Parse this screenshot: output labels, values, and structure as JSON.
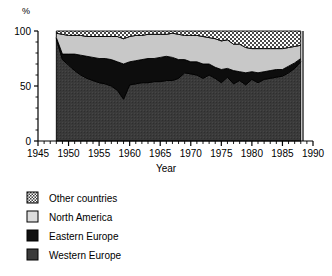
{
  "chart_data": {
    "type": "area",
    "stacked": true,
    "title": "",
    "xlabel": "Year",
    "ylabel": "%",
    "ylim": [
      0,
      100
    ],
    "xlim": [
      1945,
      1990
    ],
    "yticks": [
      0,
      50,
      100
    ],
    "ytick_labels": [
      "0",
      "50",
      "100"
    ],
    "xticks": [
      1945,
      1950,
      1955,
      1960,
      1965,
      1970,
      1975,
      1980,
      1985,
      1990
    ],
    "xtick_labels": [
      "1945",
      "1950",
      "1955",
      "1960",
      "1965",
      "1970",
      "1975",
      "1980",
      "1985",
      "1990"
    ],
    "minor_tick_interval": 1,
    "grid": false,
    "legend_position": "below",
    "data_start_year": 1948,
    "data_end_year": 1988,
    "x": [
      1948,
      1949,
      1950,
      1951,
      1952,
      1953,
      1954,
      1955,
      1956,
      1957,
      1958,
      1959,
      1960,
      1961,
      1962,
      1963,
      1964,
      1965,
      1966,
      1967,
      1968,
      1969,
      1970,
      1971,
      1972,
      1973,
      1974,
      1975,
      1976,
      1977,
      1978,
      1979,
      1980,
      1981,
      1982,
      1983,
      1984,
      1985,
      1986,
      1987,
      1988
    ],
    "series": [
      {
        "name": "Western Europe",
        "pattern": "solid-dark-gray",
        "color": "#3a3a3a",
        "values": [
          93,
          74,
          69,
          64,
          60,
          57,
          55,
          53,
          52,
          50,
          46,
          38,
          51,
          52,
          53,
          53,
          54,
          54,
          55,
          55,
          57,
          62,
          61,
          60,
          57,
          60,
          57,
          53,
          58,
          52,
          55,
          51,
          56,
          53,
          56,
          57,
          58,
          59,
          62,
          66,
          72
        ]
      },
      {
        "name": "Eastern Europe",
        "pattern": "solid-black",
        "color": "#0d0d0d",
        "values": [
          1,
          5,
          10,
          15,
          18,
          20,
          21,
          22,
          23,
          24,
          26,
          32,
          21,
          21,
          21,
          22,
          21,
          22,
          22,
          21,
          17,
          12,
          11,
          12,
          13,
          10,
          10,
          12,
          8,
          12,
          8,
          11,
          7,
          9,
          7,
          7,
          7,
          6,
          6,
          5,
          3
        ]
      },
      {
        "name": "North America",
        "pattern": "solid-light-gray",
        "color": "#c8c8c8",
        "values": [
          4,
          18,
          17,
          17,
          18,
          18,
          19,
          20,
          20,
          21,
          23,
          23,
          23,
          23,
          22,
          22,
          22,
          21,
          20,
          22,
          23,
          22,
          24,
          24,
          25,
          24,
          26,
          26,
          26,
          24,
          25,
          23,
          21,
          22,
          21,
          20,
          19,
          19,
          17,
          15,
          12
        ]
      },
      {
        "name": "Other countries",
        "pattern": "checkered",
        "color": "#b0b0b0",
        "values": [
          2,
          3,
          4,
          4,
          4,
          5,
          5,
          5,
          5,
          5,
          5,
          7,
          5,
          4,
          4,
          3,
          3,
          3,
          3,
          2,
          3,
          4,
          4,
          4,
          5,
          6,
          7,
          9,
          8,
          12,
          12,
          15,
          16,
          16,
          16,
          16,
          16,
          16,
          15,
          14,
          13
        ]
      }
    ]
  },
  "legend": {
    "items": [
      {
        "label": "Other countries",
        "pattern": "checkered"
      },
      {
        "label": "North America",
        "pattern": "solid-light-gray"
      },
      {
        "label": "Eastern Europe",
        "pattern": "solid-black"
      },
      {
        "label": "Western Europe",
        "pattern": "solid-dark-gray"
      }
    ]
  }
}
